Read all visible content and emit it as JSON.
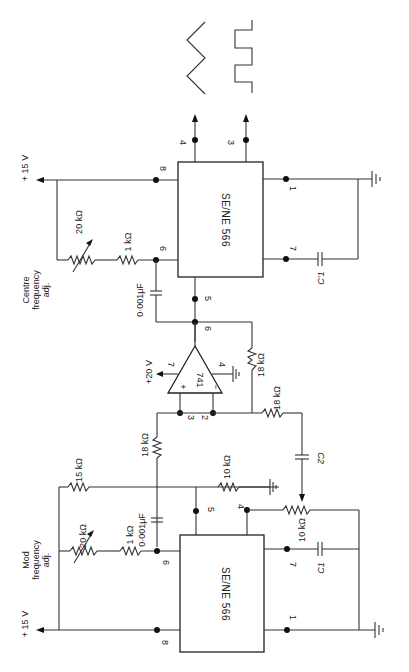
{
  "diagram": {
    "type": "circuit-schematic",
    "orientation": "rotated 90deg clockwise",
    "upper_vco": {
      "chip_label": "SE/NE 566",
      "supply_label": "+ 15 V",
      "adjust_label_1": "Centre",
      "adjust_label_2": "frequency",
      "adjust_label_3": "adj.",
      "pot_label": "20 kΩ",
      "resistor_label": "1 kΩ",
      "cap_label": "0·001μF",
      "timing_cap_label": "C'1",
      "pins": {
        "p8": "8",
        "p6": "6",
        "p5": "5",
        "p1": "1",
        "p7": "7",
        "p4": "4",
        "p3": "3"
      }
    },
    "opamp": {
      "label": "741",
      "supply_label": "+20 V",
      "pin_out": "6",
      "pin_vplus": "7",
      "pin_vminus": "4",
      "pin_noninv": "3",
      "pin_inv": "2",
      "plus_sign": "+",
      "minus_sign": "−",
      "feedback_resistor": "18 kΩ",
      "input_resistor": "18 kΩ",
      "noninv_resistor": "18 kΩ"
    },
    "lower_vco": {
      "chip_label": "SE/NE 566",
      "supply_label": "+ 15 V",
      "adjust_label_1": "Mod",
      "adjust_label_2": "frequency",
      "adjust_label_3": "adj.",
      "pot_label": "20 kΩ",
      "resistor_label": "1 kΩ",
      "cap_label": "0·001μF",
      "bias_resistor": "15 kΩ",
      "ground_resistor": "10 kΩ",
      "pot_4_label": "10 kΩ",
      "coupling_cap": "C2",
      "timing_cap_label": "C1",
      "pins": {
        "p8": "8",
        "p6": "6",
        "p5": "5",
        "p1": "1",
        "p7": "7",
        "p4": "4"
      }
    },
    "outputs": {
      "triangle_pin": "4",
      "square_pin": "3"
    }
  }
}
